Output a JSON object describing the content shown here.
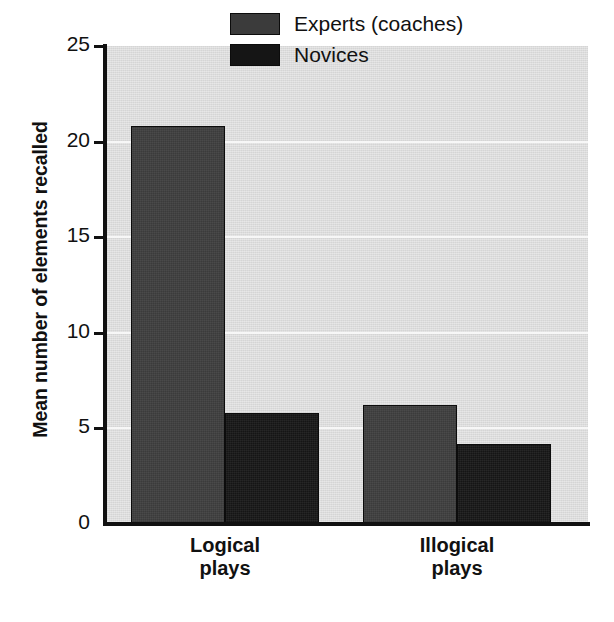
{
  "chart_data": {
    "type": "bar",
    "title": "",
    "xlabel": "",
    "ylabel": "Mean number of elements recalled",
    "categories": [
      "Logical\nplays",
      "Illogical\nplays"
    ],
    "category_lines": [
      [
        "Logical",
        "plays"
      ],
      [
        "Illogical",
        "plays"
      ]
    ],
    "series": [
      {
        "name": "Experts (coaches)",
        "values": [
          20.8,
          6.2
        ],
        "color": "#3b3b3b"
      },
      {
        "name": "Novices",
        "values": [
          5.8,
          4.2
        ],
        "color": "#151515"
      }
    ],
    "ylim": [
      0,
      25
    ],
    "ytick_labels": [
      "25",
      "20",
      "15",
      "10",
      "5",
      "0"
    ],
    "ytick_values": [
      25,
      20,
      15,
      10,
      5,
      0
    ],
    "grid": true,
    "gridline_values": [
      20,
      15,
      10,
      5
    ],
    "legend_position": "top-right",
    "plot_background": "#dcdcdc",
    "gridline_color": "#f7f7f7",
    "axis_color": "#111111"
  },
  "legend": {
    "entries": [
      {
        "label": "Experts (coaches)"
      },
      {
        "label": "Novices"
      }
    ]
  },
  "axes": {
    "y_title": "Mean number of elements recalled"
  }
}
